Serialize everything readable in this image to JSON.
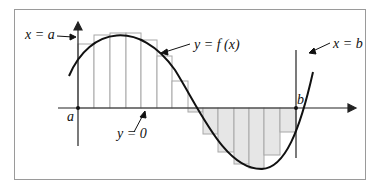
{
  "diagram": {
    "labels": {
      "x_eq_a": "x = a",
      "x_eq_b": "x = b",
      "y_eq_fx": "y = f (x)",
      "y_eq_0": "y = 0",
      "a": "a",
      "b": "b"
    },
    "colors": {
      "curve": "#111111",
      "axis": "#222222",
      "rect_fill_negative": "#e6e6e6",
      "rect_fill_positive": "#ffffff",
      "rect_stroke": "#a0a0a0",
      "border": "#9a9a9a"
    },
    "rectangle_count": 14
  }
}
